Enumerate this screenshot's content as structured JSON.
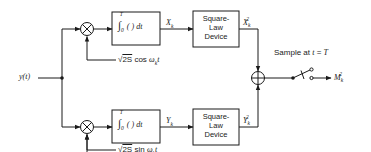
{
  "input": {
    "label": "y(t)"
  },
  "top_branch": {
    "mixer": "multiplier",
    "reference": {
      "sqrt": "2S",
      "func": "cos",
      "arg": "ω",
      "arg_sub": "k",
      "var": "t"
    },
    "integrator": {
      "lower": "0",
      "upper": "T",
      "body": "( ) dt"
    },
    "integrator_out": {
      "base": "X",
      "sub": "k"
    },
    "squarer": {
      "line1": "Square-",
      "line2": "Law",
      "line3": "Device"
    },
    "squarer_out": {
      "base": "X",
      "sub": "k",
      "sup": "2"
    }
  },
  "bottom_branch": {
    "mixer": "multiplier",
    "reference": {
      "sqrt": "2S",
      "func": "sin",
      "arg": "ω",
      "arg_sub": "k",
      "var": "t"
    },
    "integrator": {
      "lower": "0",
      "upper": "T",
      "body": "( ) dt"
    },
    "integrator_out": {
      "base": "Y",
      "sub": "k"
    },
    "squarer": {
      "line1": "Square-",
      "line2": "Law",
      "line3": "Device"
    },
    "squarer_out": {
      "base": "Y",
      "sub": "k",
      "sup": "2"
    }
  },
  "summer": "adder",
  "sampler": {
    "label_prefix": "Sample at ",
    "label_var": "t",
    "label_eq": " = ",
    "label_val": "T"
  },
  "output": {
    "base": "M",
    "sub": "k",
    "sup": "2"
  }
}
